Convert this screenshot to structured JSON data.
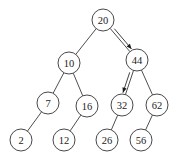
{
  "diagram": {
    "type": "binary-search-tree",
    "colors": {
      "background": "#ffffff",
      "stroke": "#333333",
      "text": "#222222"
    },
    "node_radius": 11,
    "nodes": [
      {
        "id": "n20",
        "label": "20",
        "x": 103,
        "y": 20
      },
      {
        "id": "n10",
        "label": "10",
        "x": 69,
        "y": 63
      },
      {
        "id": "n44",
        "label": "44",
        "x": 137,
        "y": 60
      },
      {
        "id": "n7",
        "label": "7",
        "x": 48,
        "y": 103
      },
      {
        "id": "n16",
        "label": "16",
        "x": 87,
        "y": 106
      },
      {
        "id": "n32",
        "label": "32",
        "x": 122,
        "y": 105
      },
      {
        "id": "n62",
        "label": "62",
        "x": 157,
        "y": 105
      },
      {
        "id": "n2",
        "label": "2",
        "x": 21,
        "y": 140
      },
      {
        "id": "n12",
        "label": "12",
        "x": 64,
        "y": 140
      },
      {
        "id": "n26",
        "label": "26",
        "x": 107,
        "y": 140
      },
      {
        "id": "n56",
        "label": "56",
        "x": 141,
        "y": 140
      }
    ],
    "edges": [
      {
        "from": "n20",
        "to": "n10",
        "search_path": false
      },
      {
        "from": "n20",
        "to": "n44",
        "search_path": true
      },
      {
        "from": "n10",
        "to": "n7",
        "search_path": false
      },
      {
        "from": "n10",
        "to": "n16",
        "search_path": false
      },
      {
        "from": "n44",
        "to": "n32",
        "search_path": true
      },
      {
        "from": "n44",
        "to": "n62",
        "search_path": false
      },
      {
        "from": "n7",
        "to": "n2",
        "search_path": false
      },
      {
        "from": "n16",
        "to": "n12",
        "search_path": false
      },
      {
        "from": "n32",
        "to": "n26",
        "search_path": false
      },
      {
        "from": "n62",
        "to": "n56",
        "search_path": false
      }
    ]
  }
}
